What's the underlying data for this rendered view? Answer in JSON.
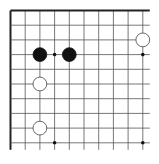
{
  "board": {
    "description": "Go board corner (top-left edges shown)",
    "origin_x": 10.5,
    "origin_y": 10.5,
    "spacing": 14.7,
    "cols": 10,
    "rows": 10,
    "line_extension": 7,
    "colors": {
      "background": "#ffffff",
      "line": "#555555",
      "border": "#222222",
      "black_stone": "#111111",
      "white_stone": "#ffffff",
      "white_stone_outline": "#444444",
      "star_point": "#111111"
    },
    "star_points": [
      {
        "col": 3,
        "row": 3
      },
      {
        "col": 9,
        "row": 3
      },
      {
        "col": 3,
        "row": 9
      },
      {
        "col": 9,
        "row": 9
      }
    ],
    "stones": [
      {
        "color": "black",
        "col": 2,
        "row": 3
      },
      {
        "color": "black",
        "col": 4,
        "row": 3
      },
      {
        "color": "white",
        "col": 9,
        "row": 2
      },
      {
        "color": "white",
        "col": 2,
        "row": 5
      },
      {
        "color": "white",
        "col": 2,
        "row": 8
      }
    ]
  }
}
